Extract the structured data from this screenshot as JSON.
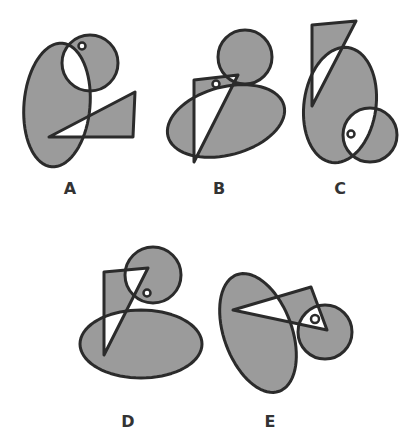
{
  "colors": {
    "background": "#ffffff",
    "fill": "#9b9b9b",
    "stroke": "#2b2b2b",
    "label": "#333333"
  },
  "figures": [
    {
      "label": "A",
      "label_pos": [
        70,
        194
      ],
      "ellipse": {
        "cx": 57,
        "cy": 105,
        "rx": 33,
        "ry": 62,
        "rotate": 5
      },
      "circle": {
        "cx": 90,
        "cy": 63,
        "r": 28
      },
      "triangle": "49,137 135,92 133,137",
      "dot": {
        "cx": 82,
        "cy": 46,
        "r": 3.5
      }
    },
    {
      "label": "B",
      "label_pos": [
        219,
        194
      ],
      "ellipse": {
        "cx": 226,
        "cy": 121,
        "rx": 60,
        "ry": 34,
        "rotate": -15
      },
      "circle": {
        "cx": 245,
        "cy": 57,
        "r": 27
      },
      "triangle": "194,80 238,75 194,162",
      "dot": {
        "cx": 216,
        "cy": 84,
        "r": 3.5
      }
    },
    {
      "label": "C",
      "label_pos": [
        340,
        194
      ],
      "ellipse": {
        "cx": 340,
        "cy": 105,
        "rx": 36,
        "ry": 58,
        "rotate": 8
      },
      "circle": {
        "cx": 370,
        "cy": 135,
        "r": 27
      },
      "triangle": "312,25 356,21 312,106",
      "dot": {
        "cx": 351,
        "cy": 134,
        "r": 3.5
      }
    },
    {
      "label": "D",
      "label_pos": [
        128,
        427
      ],
      "ellipse": {
        "cx": 141,
        "cy": 344,
        "rx": 61,
        "ry": 34,
        "rotate": 0
      },
      "circle": {
        "cx": 153,
        "cy": 275,
        "r": 28
      },
      "triangle": "104,272 148,268 104,355",
      "dot": {
        "cx": 147,
        "cy": 293,
        "r": 3.5
      }
    },
    {
      "label": "E",
      "label_pos": [
        270,
        427
      ],
      "ellipse": {
        "cx": 258,
        "cy": 333,
        "rx": 34,
        "ry": 62,
        "rotate": -20
      },
      "circle": {
        "cx": 325,
        "cy": 332,
        "r": 27
      },
      "triangle": "233,310 311,287 327,330",
      "dot": {
        "cx": 315,
        "cy": 319,
        "r": 4
      }
    }
  ]
}
